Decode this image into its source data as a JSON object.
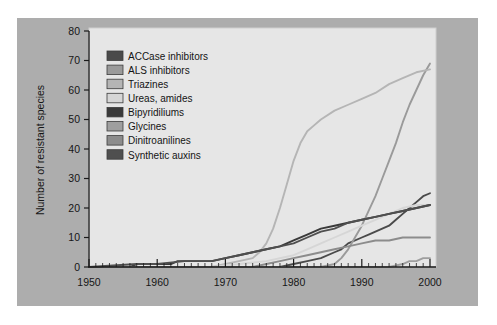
{
  "figure": {
    "background": "#ffffff",
    "frame_color": "#adadad",
    "plot_background": "#e6e6e6",
    "plot_border_color": "#cfcfcf"
  },
  "chart_data": {
    "type": "line",
    "title": "",
    "subtitle": "",
    "xlabel": "",
    "ylabel": "Number of resistant species",
    "xlim": [
      1950,
      2000
    ],
    "ylim": [
      0,
      80
    ],
    "xticks": [
      1950,
      1960,
      1970,
      1980,
      1990,
      2000
    ],
    "xtick_labels": [
      "1950",
      "1960",
      "1970",
      "1980",
      "1990",
      "2000"
    ],
    "yticks": [
      0,
      10,
      20,
      30,
      40,
      50,
      60,
      70,
      80
    ],
    "ytick_labels": [
      "0",
      "10",
      "20",
      "30",
      "40",
      "50",
      "60",
      "70",
      "80"
    ],
    "minor_xtick_step": 1,
    "grid": false,
    "legend_position": "upper-left-inside",
    "series": [
      {
        "name": "ACCase inhibitors",
        "color": "#4a4a4a",
        "x": [
          1950,
          1978,
          1980,
          1982,
          1984,
          1986,
          1987,
          1988,
          1990,
          1991,
          1992,
          1993,
          1994,
          1995,
          1996,
          1997,
          1998,
          1999,
          2000
        ],
        "values": [
          0,
          0,
          1,
          2,
          3,
          5,
          6,
          8,
          10,
          11,
          12,
          13,
          14,
          16,
          18,
          20,
          22,
          24,
          25
        ]
      },
      {
        "name": "ALS inhibitors",
        "color": "#9a9a9a",
        "x": [
          1950,
          1984,
          1986,
          1987,
          1988,
          1989,
          1990,
          1991,
          1992,
          1993,
          1994,
          1995,
          1996,
          1997,
          1998,
          1999,
          2000
        ],
        "values": [
          0,
          0,
          1,
          3,
          6,
          10,
          14,
          19,
          24,
          30,
          36,
          42,
          49,
          55,
          60,
          65,
          69
        ]
      },
      {
        "name": "Triazines",
        "color": "#b5b5b5",
        "x": [
          1950,
          1968,
          1970,
          1972,
          1974,
          1975,
          1976,
          1977,
          1978,
          1979,
          1980,
          1981,
          1982,
          1983,
          1984,
          1986,
          1988,
          1990,
          1992,
          1994,
          1996,
          1998,
          2000
        ],
        "values": [
          0,
          0,
          1,
          2,
          3,
          5,
          8,
          13,
          20,
          28,
          36,
          42,
          46,
          48,
          50,
          53,
          55,
          57,
          59,
          62,
          64,
          66,
          67
        ]
      },
      {
        "name": "Ureas, amides",
        "color": "#d6d6d6",
        "x": [
          1950,
          1968,
          1972,
          1976,
          1980,
          1982,
          1984,
          1986,
          1988,
          1990,
          1992,
          1994,
          1996,
          1998,
          2000
        ],
        "values": [
          0,
          0,
          1,
          2,
          4,
          6,
          8,
          10,
          12,
          14,
          16,
          18,
          20,
          21,
          21
        ]
      },
      {
        "name": "Bipyridiliums",
        "color": "#3a3a3a",
        "x": [
          1950,
          1956,
          1957,
          1962,
          1963,
          1968,
          1970,
          1972,
          1974,
          1976,
          1978,
          1980,
          1982,
          1984,
          1986,
          1988,
          1990,
          1992,
          1994,
          1996,
          1998,
          2000
        ],
        "values": [
          0,
          0,
          1,
          1,
          2,
          2,
          3,
          4,
          5,
          6,
          7,
          9,
          11,
          13,
          14,
          15,
          16,
          17,
          18,
          19,
          20,
          21
        ]
      },
      {
        "name": "Glycines",
        "color": "#9f9f9f",
        "x": [
          1950,
          1994,
          1996,
          1997,
          1998,
          1999,
          2000
        ],
        "values": [
          0,
          0,
          1,
          2,
          2,
          3,
          3
        ]
      },
      {
        "name": "Dinitroanilines",
        "color": "#8c8c8c",
        "x": [
          1950,
          1974,
          1976,
          1978,
          1980,
          1982,
          1984,
          1986,
          1988,
          1990,
          1992,
          1994,
          1996,
          1998,
          2000
        ],
        "values": [
          0,
          0,
          1,
          2,
          3,
          4,
          5,
          6,
          7,
          8,
          9,
          9,
          10,
          10,
          10
        ]
      },
      {
        "name": "Synthetic auxins",
        "color": "#4f4f4f",
        "x": [
          1950,
          1957,
          1960,
          1964,
          1968,
          1970,
          1972,
          1974,
          1976,
          1978,
          1980,
          1982,
          1984,
          1986,
          1988,
          1990,
          1992,
          1994,
          1996,
          1998,
          2000
        ],
        "values": [
          0,
          1,
          1,
          2,
          2,
          3,
          4,
          5,
          6,
          7,
          8,
          10,
          12,
          13,
          15,
          16,
          17,
          18,
          19,
          20,
          21
        ]
      }
    ],
    "legend_entries": [
      {
        "label": "ACCase inhibitors",
        "color": "#4a4a4a"
      },
      {
        "label": "ALS inhibitors",
        "color": "#9a9a9a"
      },
      {
        "label": "Triazines",
        "color": "#b5b5b5"
      },
      {
        "label": "Ureas, amides",
        "color": "#d6d6d6"
      },
      {
        "label": "Bipyridiliums",
        "color": "#3a3a3a"
      },
      {
        "label": "Glycines",
        "color": "#9f9f9f"
      },
      {
        "label": "Dinitroanilines",
        "color": "#8c8c8c"
      },
      {
        "label": "Synthetic auxins",
        "color": "#4f4f4f"
      }
    ]
  }
}
